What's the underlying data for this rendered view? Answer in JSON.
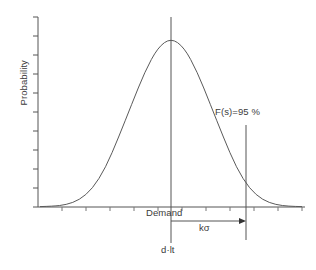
{
  "chart_data": {
    "type": "line",
    "title": "",
    "subtitle": "",
    "xlabel": "",
    "ylabel": "Probability",
    "grid": false,
    "legend": null,
    "axis": {
      "x_range": [
        0,
        1
      ],
      "y_range": [
        0,
        1
      ],
      "x_ticks_labeled": false,
      "y_ticks_labeled": false,
      "x_tick_count": 11,
      "y_tick_count": 10
    },
    "distribution": {
      "shape": "normal",
      "mean_label": "d·lt",
      "center_x_label": "Demand",
      "peak_normalized_x": 0.5,
      "peak_normalized_y": 1.0
    },
    "series": [
      {
        "name": "probability-density",
        "x": [
          0.0,
          0.05,
          0.1,
          0.15,
          0.2,
          0.25,
          0.3,
          0.35,
          0.4,
          0.45,
          0.5,
          0.55,
          0.6,
          0.65,
          0.7,
          0.75,
          0.8,
          0.85,
          0.9,
          0.95,
          1.0
        ],
        "y": [
          0.0,
          0.002,
          0.011,
          0.039,
          0.105,
          0.229,
          0.411,
          0.607,
          0.8,
          0.945,
          1.0,
          0.945,
          0.8,
          0.607,
          0.411,
          0.229,
          0.105,
          0.039,
          0.011,
          0.002,
          0.0
        ]
      }
    ],
    "annotations": [
      {
        "name": "service-level",
        "text": "F(s)=95 %",
        "value": 95,
        "unit": "%",
        "marker": "vertical-line",
        "normalized_x": 0.78
      },
      {
        "name": "safety-stock",
        "text": "kσ",
        "marker": "horizontal-arrow",
        "from_normalized_x": 0.5,
        "to_normalized_x": 0.78
      },
      {
        "name": "mean-demand",
        "text": "d·lt",
        "marker": "vertical-line",
        "normalized_x": 0.5
      },
      {
        "name": "demand-axis",
        "text": "Demand"
      }
    ],
    "colors": {
      "background": "#ffffff",
      "axis": "#555555",
      "curve": "#5a5a5a",
      "annotation_line": "#555555",
      "text": "#3b3b3b"
    }
  },
  "figure": {
    "y_axis_label": "Probability",
    "demand_label": "Demand",
    "mean_label": "d·lt",
    "safety_stock_label": "kσ",
    "service_level_label": "F(s)=95 %"
  }
}
